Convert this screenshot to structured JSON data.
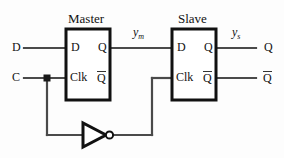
{
  "diagram": {
    "kind": "master-slave-d-flip-flop",
    "background_color": "#fdfdfd",
    "wire_color": "#4a4a4a",
    "box_color": "#111111",
    "titles": {
      "master": "Master",
      "slave": "Slave"
    },
    "master_pins": {
      "d": "D",
      "q": "Q",
      "clk": "Clk",
      "qbar": "Q"
    },
    "slave_pins": {
      "d": "D",
      "q": "Q",
      "clk": "Clk",
      "qbar": "Q"
    },
    "inputs": {
      "data": "D",
      "clock": "C"
    },
    "outputs": {
      "q": "Q",
      "qbar": "Q"
    },
    "signals": {
      "master_out_base": "y",
      "master_out_sub": "m",
      "slave_out_base": "y",
      "slave_out_sub": "s"
    },
    "inverter": {
      "name": "inverter",
      "bubble": "o"
    }
  }
}
